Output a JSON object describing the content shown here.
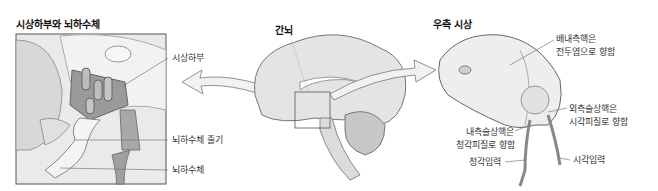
{
  "left_panel": {
    "title": "시상하부와 뇌하수체",
    "labels": {
      "hypothalamus": "시상하부",
      "pituitary_stalk": "뇌하수체 줄기",
      "pituitary": "뇌하수체"
    }
  },
  "center_panel": {
    "title": "간뇌"
  },
  "right_panel": {
    "title": "우측 시상",
    "labels": {
      "pulvinar_line1": "배내측핵은",
      "pulvinar_line2": "전두엽으로 향함",
      "lgn_line1": "외측슬상핵은",
      "lgn_line2": "시각피질로 향함",
      "mgn_line1": "내측슬상핵은",
      "mgn_line2": "청각피질로 향함",
      "auditory_input": "청각입력",
      "visual_input": "시각입력"
    }
  }
}
